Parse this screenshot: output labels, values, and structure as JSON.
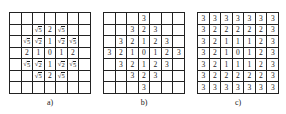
{
  "panels": [
    {
      "id": "a",
      "label": "a)",
      "left": 9,
      "cells": [
        [
          "",
          "",
          "",
          "",
          "",
          "",
          ""
        ],
        [
          "",
          "",
          "√5",
          "2",
          "√5",
          "",
          ""
        ],
        [
          "",
          "√5",
          "√2",
          "1",
          "√2",
          "√5",
          ""
        ],
        [
          "",
          "2",
          "1",
          "0",
          "1",
          "2",
          ""
        ],
        [
          "",
          "√5",
          "√2",
          "1",
          "√2",
          "√5",
          ""
        ],
        [
          "",
          "",
          "√5",
          "2",
          "√5",
          "",
          ""
        ],
        [
          "",
          "",
          "",
          "",
          "",
          "",
          ""
        ]
      ]
    },
    {
      "id": "b",
      "label": "b)",
      "left": 103,
      "cells": [
        [
          "",
          "",
          "",
          "3",
          "",
          "",
          ""
        ],
        [
          "",
          "",
          "3",
          "2",
          "3",
          "",
          ""
        ],
        [
          "",
          "3",
          "2",
          "1",
          "2",
          "3",
          ""
        ],
        [
          "3",
          "2",
          "1",
          "0",
          "1",
          "2",
          "3"
        ],
        [
          "",
          "3",
          "2",
          "1",
          "2",
          "3",
          ""
        ],
        [
          "",
          "",
          "3",
          "2",
          "3",
          "",
          ""
        ],
        [
          "",
          "",
          "",
          "3",
          "",
          "",
          ""
        ]
      ]
    },
    {
      "id": "c",
      "label": "c)",
      "left": 197,
      "cells": [
        [
          "3",
          "3",
          "3",
          "3",
          "3",
          "3",
          "3"
        ],
        [
          "3",
          "2",
          "2",
          "2",
          "2",
          "2",
          "3"
        ],
        [
          "3",
          "2",
          "1",
          "1",
          "1",
          "2",
          "3"
        ],
        [
          "3",
          "2",
          "1",
          "0",
          "1",
          "2",
          "3"
        ],
        [
          "3",
          "2",
          "1",
          "1",
          "1",
          "2",
          "3"
        ],
        [
          "3",
          "2",
          "2",
          "2",
          "2",
          "2",
          "3"
        ],
        [
          "3",
          "3",
          "3",
          "3",
          "3",
          "3",
          "3"
        ]
      ]
    }
  ]
}
